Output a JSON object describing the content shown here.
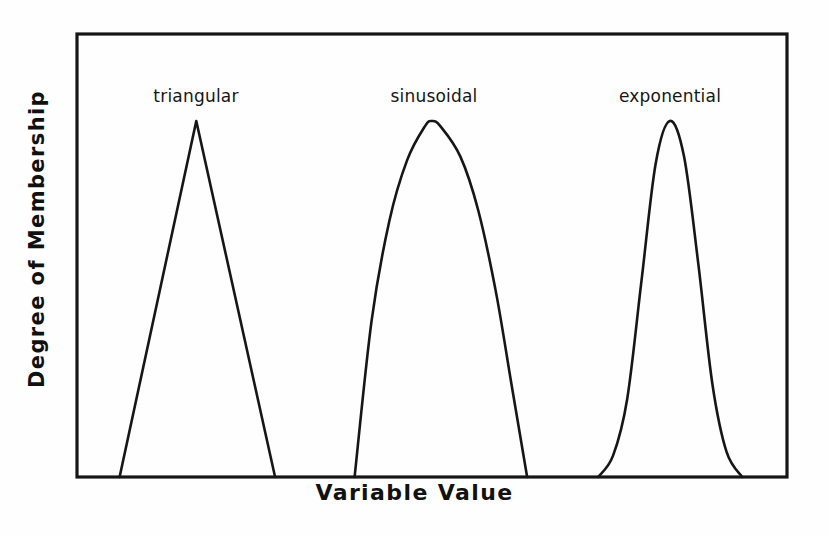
{
  "figure": {
    "background_color": "#fefefe",
    "ink_color": "#161616",
    "width": 829,
    "height": 536
  },
  "axes": {
    "x_title": "Variable Value",
    "y_title": "Degree of Membership",
    "frame": {
      "left": 77,
      "top": 34,
      "right": 787,
      "bottom": 477
    },
    "ticks_shown": false,
    "grid_shown": false
  },
  "labels": {
    "triangular": "triangular",
    "sinusoidal": "sinusoidal",
    "exponential": "exponential"
  },
  "chart_data": {
    "type": "line",
    "title": "",
    "subtitle": "",
    "xlabel": "Variable Value",
    "ylabel": "Degree of Membership",
    "xlim": [
      0,
      1
    ],
    "ylim": [
      0,
      1
    ],
    "grid": false,
    "legend_position": "inline-above-each-curve",
    "axis_tick_labels": {
      "x": [],
      "y": []
    },
    "annotations": [
      {
        "text": "triangular",
        "x": 0.168,
        "y": 1.05
      },
      {
        "text": "sinusoidal",
        "x": 0.5,
        "y": 1.05
      },
      {
        "text": "exponential",
        "x": 0.835,
        "y": 1.05
      }
    ],
    "series": [
      {
        "name": "triangular",
        "shape": "triangular",
        "color": "#161616",
        "support": [
          0.06,
          0.279
        ],
        "peak_x": 0.168,
        "peak_y": 1.0,
        "points_x": [
          0.06,
          0.168,
          0.279
        ],
        "points_y": [
          0.0,
          1.0,
          0.0
        ]
      },
      {
        "name": "sinusoidal",
        "shape": "sinusoidal",
        "color": "#161616",
        "support": [
          0.391,
          0.634
        ],
        "peak_x": 0.5,
        "peak_y": 1.0,
        "points_x": [
          0.391,
          0.415,
          0.44,
          0.465,
          0.49,
          0.5,
          0.512,
          0.54,
          0.565,
          0.59,
          0.612,
          0.634
        ],
        "points_y": [
          0.0,
          0.44,
          0.72,
          0.89,
          0.985,
          1.0,
          0.985,
          0.9,
          0.75,
          0.52,
          0.26,
          0.0
        ]
      },
      {
        "name": "exponential",
        "shape": "exponential",
        "color": "#161616",
        "support": [
          0.734,
          0.937
        ],
        "peak_x": 0.835,
        "peak_y": 1.0,
        "points_x": [
          0.734,
          0.755,
          0.775,
          0.795,
          0.815,
          0.835,
          0.855,
          0.875,
          0.895,
          0.915,
          0.937
        ],
        "points_y": [
          0.0,
          0.06,
          0.22,
          0.55,
          0.88,
          1.0,
          0.9,
          0.6,
          0.26,
          0.07,
          0.0
        ]
      }
    ]
  }
}
